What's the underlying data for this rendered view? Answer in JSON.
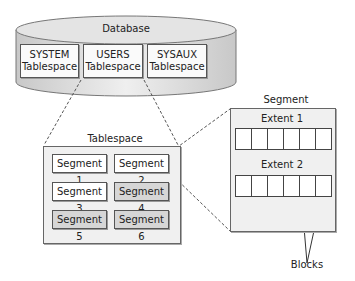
{
  "database": {
    "label": "Database",
    "tablespaces": [
      {
        "line1": "SYSTEM",
        "line2": "Tablespace"
      },
      {
        "line1": "USERS",
        "line2": "Tablespace"
      },
      {
        "line1": "SYSAUX",
        "line2": "Tablespace"
      }
    ]
  },
  "tablespace": {
    "label": "Tablespace",
    "segments": [
      {
        "label": "Segment 1",
        "shade": "white"
      },
      {
        "label": "Segment 2",
        "shade": "white"
      },
      {
        "label": "Segment 3",
        "shade": "white"
      },
      {
        "label": "Segment 4",
        "shade": "gray"
      },
      {
        "label": "Segment 5",
        "shade": "gray"
      },
      {
        "label": "Segment 6",
        "shade": "gray"
      }
    ]
  },
  "segment": {
    "label": "Segment",
    "extents": [
      {
        "label": "Extent 1",
        "blocks": 6
      },
      {
        "label": "Extent 2",
        "blocks": 6
      }
    ]
  },
  "annotation": {
    "blocks_label": "Blocks"
  },
  "colors": {
    "cylinder_fill": "#dcdcdc",
    "container_fill": "#f0f0f0",
    "gray_segment": "#d6d6d6",
    "border": "#555555"
  }
}
